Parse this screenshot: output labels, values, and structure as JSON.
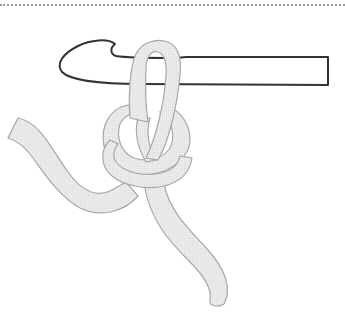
{
  "illustration": {
    "subject": "crochet hook with slip knot",
    "colors": {
      "background": "#ffffff",
      "yarn_fill": "#e8e8e8",
      "yarn_outline": "#a8a8a8",
      "hook_outline": "#333333",
      "hook_fill": "#ffffff",
      "dotted_border": "#9a9a9a"
    }
  }
}
